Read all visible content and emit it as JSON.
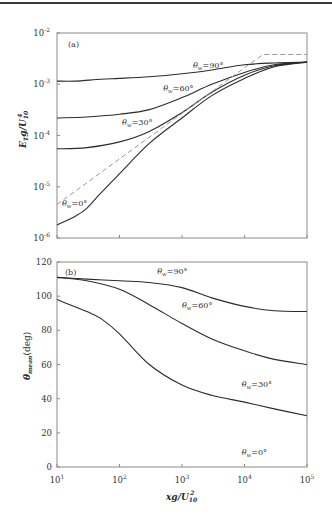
{
  "chart_data": [
    {
      "panel": "(a)",
      "type": "line",
      "xscale": "log",
      "yscale": "log",
      "xlabel": "xg/U_10^2",
      "ylabel": "E_T g/U_10^4",
      "xlim": [
        10,
        100000
      ],
      "ylim": [
        1e-06,
        0.01
      ],
      "x_ticks": [
        "10^1",
        "10^2",
        "10^3",
        "10^4",
        "10^5"
      ],
      "y_ticks": [
        "10^-6",
        "10^-5",
        "10^-4",
        "10^-3",
        "10^-2"
      ],
      "grid": false,
      "series": [
        {
          "name": "θw=90°",
          "style": "solid",
          "x": [
            10,
            20,
            50,
            100,
            300,
            1000,
            3000,
            10000,
            30000,
            100000
          ],
          "y": [
            0.00115,
            0.00115,
            0.00125,
            0.0013,
            0.0014,
            0.0016,
            0.0019,
            0.0024,
            0.0026,
            0.0027
          ]
        },
        {
          "name": "θw=60°",
          "style": "solid",
          "x": [
            10,
            30,
            100,
            300,
            1000,
            3000,
            10000,
            30000,
            100000
          ],
          "y": [
            0.00022,
            0.00023,
            0.00026,
            0.00032,
            0.00055,
            0.001,
            0.0017,
            0.0024,
            0.0027
          ]
        },
        {
          "name": "θw=30°",
          "style": "solid",
          "x": [
            10,
            30,
            100,
            300,
            1000,
            3000,
            10000,
            30000,
            100000
          ],
          "y": [
            5.5e-05,
            5.8e-05,
            7.5e-05,
            0.00012,
            0.00028,
            0.0007,
            0.0015,
            0.0023,
            0.0027
          ]
        },
        {
          "name": "θw=0°",
          "style": "solid",
          "x": [
            10,
            20,
            30,
            50,
            100,
            300,
            1000,
            3000,
            10000,
            30000,
            100000
          ],
          "y": [
            1.8e-06,
            2.7e-06,
            3.8e-06,
            7.5e-06,
            1.8e-05,
            7e-05,
            0.00022,
            0.0006,
            0.0013,
            0.0022,
            0.0027
          ]
        },
        {
          "name": "reference (dashed)",
          "style": "dashed",
          "x": [
            10,
            100,
            1000,
            10000,
            20000,
            100000
          ],
          "y": [
            4.5e-06,
            3.5e-05,
            0.00027,
            0.0021,
            0.0038,
            0.0038
          ]
        }
      ],
      "annotations": [
        {
          "text": "θw=90°",
          "x": 1500,
          "y": 0.0021
        },
        {
          "text": "θw=60°",
          "x": 500,
          "y": 0.00075
        },
        {
          "text": "θw=30°",
          "x": 110,
          "y": 0.00016
        },
        {
          "text": "θw=0°",
          "x": 12,
          "y": 4.2e-06
        }
      ]
    },
    {
      "panel": "(b)",
      "type": "line",
      "xscale": "log",
      "yscale": "linear",
      "xlabel": "xg/U_10^2",
      "ylabel": "θ_mean(deg)",
      "xlim": [
        10,
        100000
      ],
      "ylim": [
        0,
        120
      ],
      "x_ticks": [
        "10^1",
        "10^2",
        "10^3",
        "10^4",
        "10^5"
      ],
      "y_ticks": [
        0,
        20,
        40,
        60,
        80,
        100,
        120
      ],
      "grid": false,
      "series": [
        {
          "name": "θw=90°",
          "style": "solid",
          "x": [
            10,
            30,
            100,
            300,
            1000,
            3000,
            10000,
            30000,
            100000
          ],
          "y": [
            111,
            110,
            109,
            108,
            105,
            99,
            94,
            91.5,
            91
          ]
        },
        {
          "name": "θw=60°",
          "style": "solid",
          "x": [
            10,
            30,
            100,
            300,
            1000,
            3000,
            10000,
            30000,
            100000
          ],
          "y": [
            111,
            109,
            104,
            95,
            84,
            75,
            68,
            63,
            60
          ]
        },
        {
          "name": "θw=30°",
          "style": "solid",
          "x": [
            10,
            30,
            50,
            100,
            300,
            1000,
            3000,
            10000,
            30000,
            100000
          ],
          "y": [
            98,
            91,
            87,
            78,
            60,
            48,
            42,
            38,
            34,
            30
          ]
        }
      ],
      "annotations": [
        {
          "text": "θw=90°",
          "x": 400,
          "y": 113
        },
        {
          "text": "θw=60°",
          "x": 1000,
          "y": 93
        },
        {
          "text": "θw=30°",
          "x": 9000,
          "y": 47
        },
        {
          "text": "θw=0°",
          "x": 9000,
          "y": 7
        }
      ]
    }
  ],
  "labels": {
    "panel_a": "(a)",
    "panel_b": "(b)",
    "ylabel_a": "E",
    "ylabel_a_sub": "T",
    "ylabel_a_rest": "g/U",
    "ylabel_a_sub2": "10",
    "ylabel_a_sup2": "4",
    "ylabel_b": "θ",
    "ylabel_b_sub": "mean",
    "ylabel_b_rest": "(deg)",
    "xlabel": "xg/U",
    "xlabel_sub": "10",
    "xlabel_sup": "2",
    "theta_sym": "θ",
    "theta_sub": "w"
  },
  "ticks": {
    "x": [
      {
        "base": "10",
        "exp": "1"
      },
      {
        "base": "10",
        "exp": "2"
      },
      {
        "base": "10",
        "exp": "3"
      },
      {
        "base": "10",
        "exp": "4"
      },
      {
        "base": "10",
        "exp": "5"
      }
    ],
    "ya": [
      {
        "base": "10",
        "exp": "-2"
      },
      {
        "base": "10",
        "exp": "-3"
      },
      {
        "base": "10",
        "exp": "-4"
      },
      {
        "base": "10",
        "exp": "-5"
      },
      {
        "base": "10",
        "exp": "-6"
      }
    ],
    "yb": [
      "120",
      "100",
      "80",
      "60",
      "40",
      "20",
      "0"
    ]
  },
  "colors": {
    "curve": "#2b2b2b",
    "dashed": "#9a9a9a",
    "frame": "#8a8a8a"
  }
}
